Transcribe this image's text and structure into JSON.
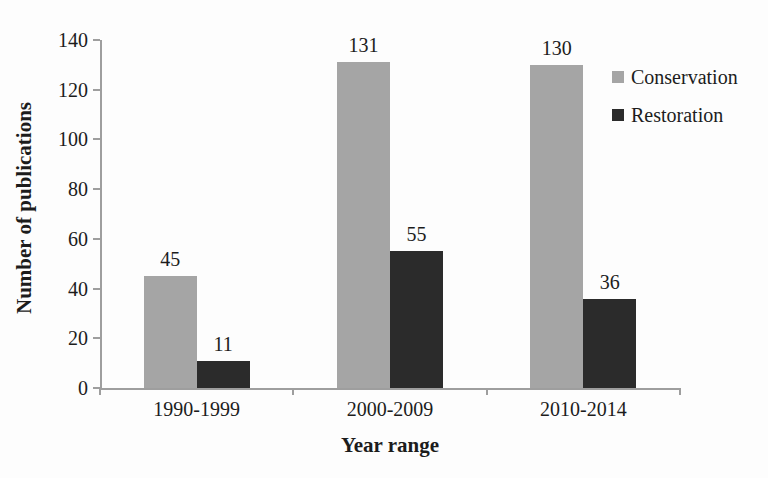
{
  "figure": {
    "background": "#fdfdfd",
    "axis_color": "#9e9e9e",
    "text_color": "#1c1c1c"
  },
  "chart_data": {
    "type": "bar",
    "title": "",
    "categories": [
      "1990-1999",
      "2000-2009",
      "2010-2014"
    ],
    "series": [
      {
        "name": "Conservation",
        "values": [
          45,
          131,
          130
        ],
        "color": "#a5a5a5"
      },
      {
        "name": "Restoration",
        "values": [
          11,
          55,
          36
        ],
        "color": "#2b2b2b"
      }
    ],
    "xlabel": "Year range",
    "ylabel": "Number of publications",
    "ylim": [
      0,
      140
    ],
    "yticks": [
      0,
      20,
      40,
      60,
      80,
      100,
      120,
      140
    ],
    "grid": false,
    "bar_value_labels": true,
    "legend_position": "top-right",
    "legend": [
      "Conservation",
      "Restoration"
    ]
  }
}
